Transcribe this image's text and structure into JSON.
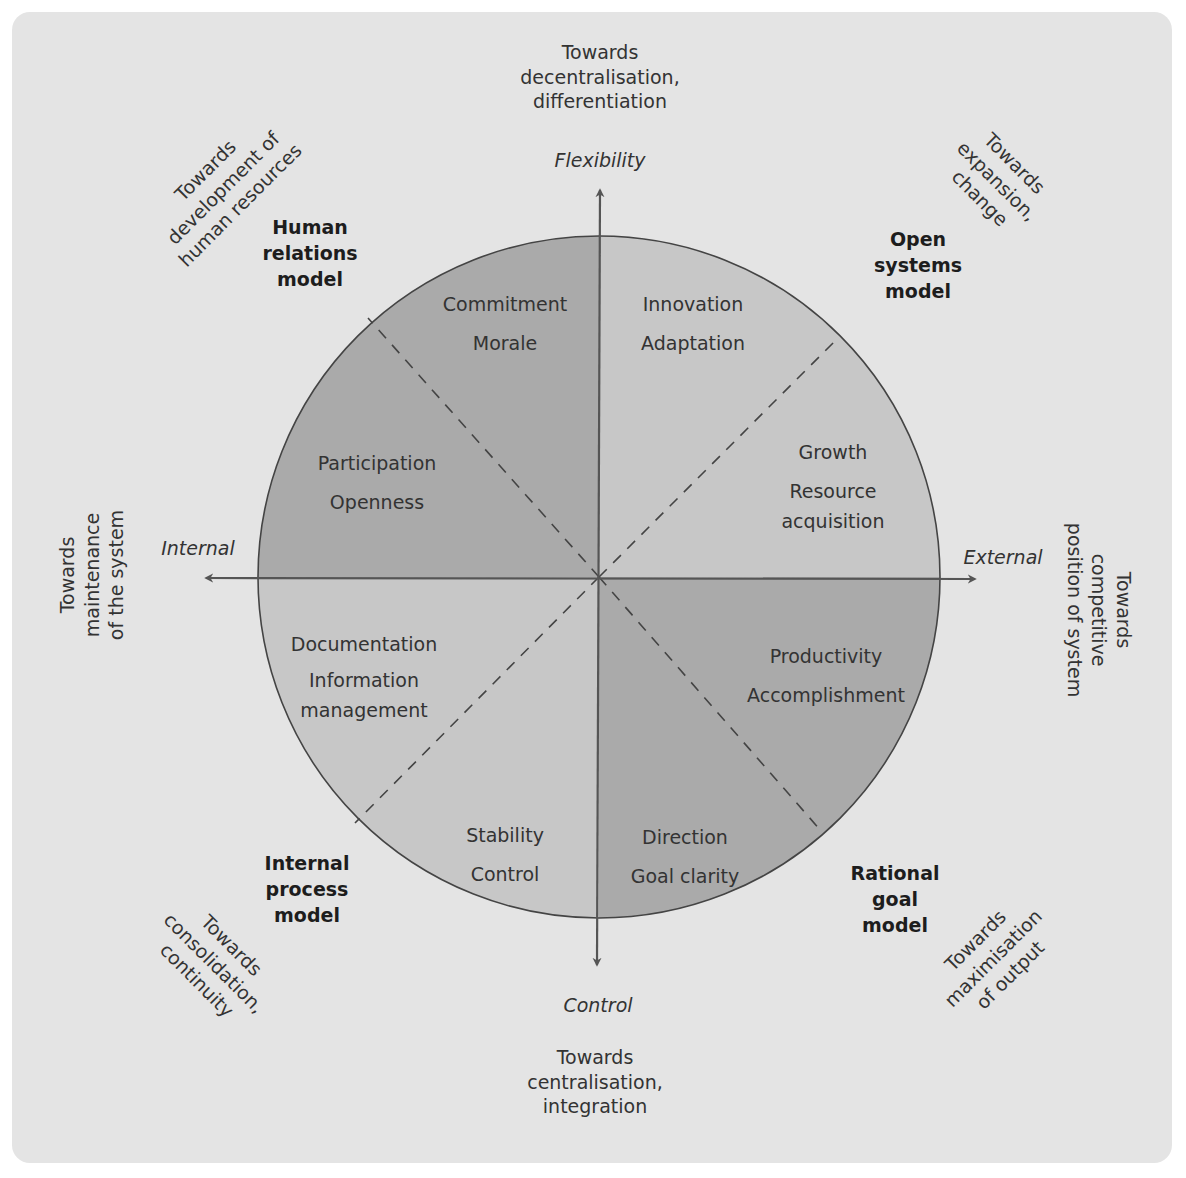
{
  "diagram": {
    "colors": {
      "background": "#e4e4e4",
      "quadrant_dark": "#a9a9a9",
      "quadrant_light": "#c6c6c6",
      "line": "#444444",
      "text": "#2a2a2a"
    },
    "axes": {
      "top": {
        "name": "Flexibility",
        "direction": [
          "Towards",
          "decentralisation,",
          "differentiation"
        ]
      },
      "bottom": {
        "name": "Control",
        "direction": [
          "Towards",
          "centralisation,",
          "integration"
        ]
      },
      "left": {
        "name": "Internal",
        "direction": [
          "Towards",
          "maintenance",
          "of the system"
        ]
      },
      "right": {
        "name": "External",
        "direction": [
          "Towards",
          "competitive",
          "position of system"
        ]
      }
    },
    "models": {
      "human_relations": {
        "name": [
          "Human",
          "relations",
          "model"
        ],
        "direction": [
          "Towards",
          "development of",
          "human resources"
        ]
      },
      "open_systems": {
        "name": [
          "Open",
          "systems",
          "model"
        ],
        "direction": [
          "Towards",
          "expansion,",
          "change"
        ]
      },
      "internal_process": {
        "name": [
          "Internal",
          "process",
          "model"
        ],
        "direction": [
          "Towards",
          "consolidation,",
          "continuity"
        ]
      },
      "rational_goal": {
        "name": [
          "Rational",
          "goal",
          "model"
        ],
        "direction": [
          "Towards",
          "maximisation",
          "of output"
        ]
      }
    },
    "segments": {
      "hr_upper": [
        "Commitment",
        "Morale"
      ],
      "hr_lower": [
        "Participation",
        "Openness"
      ],
      "os_upper": [
        "Innovation",
        "Adaptation"
      ],
      "os_lower": [
        "Growth",
        "Resource",
        "acquisition"
      ],
      "ip_upper": [
        "Documentation",
        "Information",
        "management"
      ],
      "ip_lower": [
        "Stability",
        "Control"
      ],
      "rg_upper": [
        "Productivity",
        "Accomplishment"
      ],
      "rg_lower": [
        "Direction",
        "Goal clarity"
      ]
    }
  }
}
